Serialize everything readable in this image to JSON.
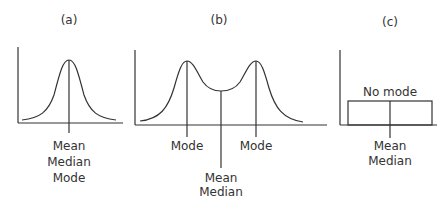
{
  "panels": [
    {
      "id": "a",
      "title": "(a)",
      "labels": [
        "Mean",
        "Median",
        "Mode"
      ],
      "shape": "unimodal-symmetric"
    },
    {
      "id": "b",
      "title": "(b)",
      "mode_label_left": "Mode",
      "mode_label_right": "Mode",
      "center_labels": [
        "Mean",
        "Median"
      ],
      "shape": "bimodal"
    },
    {
      "id": "c",
      "title": "(c)",
      "top_label": "No mode",
      "center_labels": [
        "Mean",
        "Median"
      ],
      "shape": "uniform"
    }
  ],
  "colors": {
    "line": "#333333",
    "background": "#ffffff"
  }
}
